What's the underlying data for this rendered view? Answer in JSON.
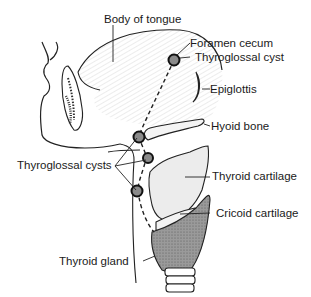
{
  "diagram": {
    "labels": {
      "body_of_tongue": "Body of tongue",
      "foramen_cecum": "Foramen cecum",
      "thyroglossal_cyst": "Thyroglossal cyst",
      "epiglottis": "Epiglottis",
      "hyoid_bone": "Hyoid bone",
      "thyroglossal_cysts": "Thyroglossal cysts",
      "thyroid_cartilage": "Thyroid cartilage",
      "cricoid_cartilage": "Cricoid cartilage",
      "thyroid_gland": "Thyroid gland"
    },
    "colors": {
      "line": "#222222",
      "cyst_fill": "#8a8a8a",
      "gland_fill": "#8c8c8c",
      "cartilage_fill": "#ebebeb",
      "background": "#ffffff"
    }
  }
}
